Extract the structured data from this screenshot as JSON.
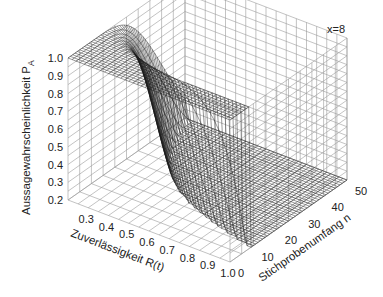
{
  "chart_data": {
    "type": "surface3d",
    "title": "",
    "annotation": "x=8",
    "xlabel": "Zuverlässigkeit R(t)",
    "ylabel": "Stichprobenumfang n",
    "zlabel": "Aussagewahrscheinlichkeit P",
    "zlabel_subscript": "A",
    "x_ticks": [
      "0.3",
      "0.4",
      "0.5",
      "0.6",
      "0.7",
      "0.8",
      "0.9",
      "1.0"
    ],
    "x_range": [
      0.2,
      1.0
    ],
    "y_ticks": [
      "0",
      "10",
      "20",
      "30",
      "40",
      "50"
    ],
    "y_range": [
      0,
      50
    ],
    "z_ticks": [
      "0.2",
      "0.3",
      "0.4",
      "0.5",
      "0.6",
      "0.7",
      "0.8",
      "0.9",
      "1.0"
    ],
    "z_range": [
      0.2,
      1.0
    ],
    "formula": "P_A = 1 - sum_{i=0}^{x} C(n,i) (1-R)^i R^(n-i)",
    "parameter_x": 8,
    "grid": true,
    "mesh": "wireframe"
  },
  "colors": {
    "background": "#ffffff",
    "grid": "#9a9a9a",
    "mesh": "#1a1a1a",
    "text": "#222222"
  }
}
